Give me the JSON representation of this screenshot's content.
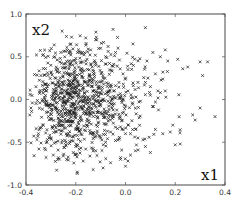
{
  "chart_data": {
    "type": "scatter",
    "title": "",
    "xlabel": "x1",
    "ylabel": "x2",
    "xlim": [
      -0.4,
      0.4
    ],
    "ylim": [
      -1.0,
      1.0
    ],
    "xticks": [
      -0.4,
      -0.2,
      0.0,
      0.2,
      0.4
    ],
    "yticks": [
      -1.0,
      -0.5,
      0.0,
      0.5,
      1.0
    ],
    "xtick_labels": [
      "-0.4",
      "-0.2",
      "0.0",
      "0.2",
      "0.4"
    ],
    "ytick_labels": [
      "-1.0",
      "-0.5",
      "0.0",
      "0.5",
      "1.0"
    ],
    "grid": false,
    "legend": null,
    "marker": "x",
    "marker_color": "#222222",
    "series": [
      {
        "name": "samples",
        "x": [
          0.08,
          -0.05,
          -0.16,
          -0.12,
          0.11,
          0.16,
          0.14,
          0.17,
          0.3,
          0.33,
          0.21,
          0.23,
          0.25,
          0.31,
          0.36,
          0.3,
          0.2,
          0.22,
          0.05,
          0.07,
          0.1,
          0.12,
          0.15,
          0.18,
          0.19,
          0.27,
          0.28,
          0.16,
          0.14,
          0.1,
          0.06,
          0.02,
          0.0,
          -0.02,
          0.04,
          0.08,
          0.03,
          -0.03,
          -0.07,
          -0.1,
          -0.14,
          -0.18,
          -0.22,
          -0.26,
          -0.3,
          -0.34,
          -0.36,
          -0.38,
          -0.33,
          -0.29,
          -0.25,
          -0.21,
          -0.17,
          -0.13,
          -0.09,
          -0.06,
          -0.02,
          0.01,
          -0.28,
          -0.24,
          -0.2,
          -0.16,
          -0.12,
          -0.08,
          -0.04,
          -0.32,
          -0.27,
          -0.23,
          -0.19,
          -0.15,
          -0.11,
          -0.07,
          -0.03,
          0.01,
          0.05,
          0.09,
          0.12,
          -0.31,
          -0.26,
          -0.22,
          -0.18,
          -0.14,
          -0.1,
          -0.06,
          -0.02,
          0.02,
          -0.35,
          -0.3,
          -0.24,
          -0.2,
          -0.16,
          -0.12,
          -0.08,
          -0.04,
          0.0,
          0.04,
          -0.11,
          -0.09,
          -0.13,
          -0.07,
          0.01,
          -0.01,
          0.08,
          0.1,
          0.13,
          0.15
        ],
        "y": [
          0.84,
          0.82,
          0.72,
          0.7,
          0.55,
          0.58,
          0.5,
          0.45,
          0.44,
          0.44,
          0.47,
          0.36,
          0.38,
          0.28,
          -0.2,
          -0.1,
          -0.53,
          -0.52,
          -0.45,
          -0.47,
          -0.62,
          -0.35,
          -0.4,
          -0.38,
          -0.3,
          -0.18,
          -0.24,
          0.1,
          0.08,
          0.05,
          -0.02,
          -0.65,
          -0.78,
          -0.7,
          -0.6,
          -0.55,
          0.65,
          0.6,
          0.62,
          0.6,
          0.58,
          0.55,
          0.52,
          0.55,
          0.4,
          0.28,
          0.15,
          -0.1,
          -0.3,
          -0.65,
          -0.66,
          -0.62,
          -0.72,
          -0.82,
          -0.8,
          -0.74,
          -0.68,
          -0.72,
          0.35,
          0.42,
          0.48,
          0.45,
          0.4,
          0.5,
          0.55,
          0.1,
          0.05,
          0.0,
          -0.05,
          0.02,
          0.08,
          -0.02,
          0.05,
          0.1,
          0.2,
          0.25,
          0.3,
          -0.2,
          -0.25,
          -0.3,
          -0.35,
          -0.4,
          -0.45,
          -0.38,
          -0.32,
          -0.4,
          -0.4,
          -0.45,
          -0.5,
          -0.55,
          -0.58,
          -0.6,
          -0.5,
          -0.48,
          -0.4,
          -0.35,
          0.15,
          0.25,
          -0.15,
          -0.25,
          0.35,
          0.3,
          0.2,
          0.15,
          0.1,
          0.32
        ]
      }
    ],
    "n_points_approx": 1000,
    "distribution_note": "dense cloud centered near x1=-0.2, x2=0.0; sparse tail toward x1=0.37"
  },
  "plot": {
    "x_axis_label": "x1",
    "y_axis_label": "x2",
    "frame": {
      "left": 26,
      "top": 14,
      "right": 225,
      "bottom": 185
    },
    "cloud": {
      "cx": -0.19,
      "cy": -0.02,
      "sx": 0.105,
      "sy": 0.32,
      "count": 900,
      "seed": 7
    }
  }
}
